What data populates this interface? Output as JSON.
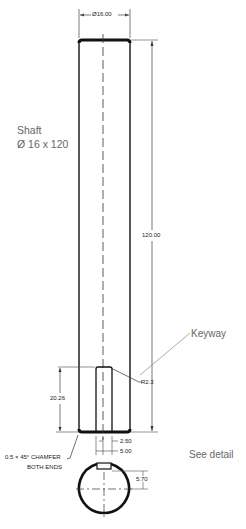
{
  "drawing": {
    "title_line1": "Shaft",
    "title_line2": "Ø 16 x 120",
    "callouts": {
      "keyway": "Keyway",
      "see_detail": "See detail"
    },
    "dimensions": {
      "diameter": "Ø16.00",
      "length": "120.00",
      "keyway_length": "20.26",
      "keyway_radius": "R2.3",
      "keyway_offset": "2.50",
      "keyway_width": "5.00",
      "keyway_depth": "5.70"
    },
    "notes": {
      "chamfer_line1": "0.5 × 45° CHAMFER",
      "chamfer_line2": "BOTH ENDS"
    },
    "colors": {
      "line": "#111111",
      "dim_line": "#444444",
      "annotation": "#666666"
    }
  }
}
